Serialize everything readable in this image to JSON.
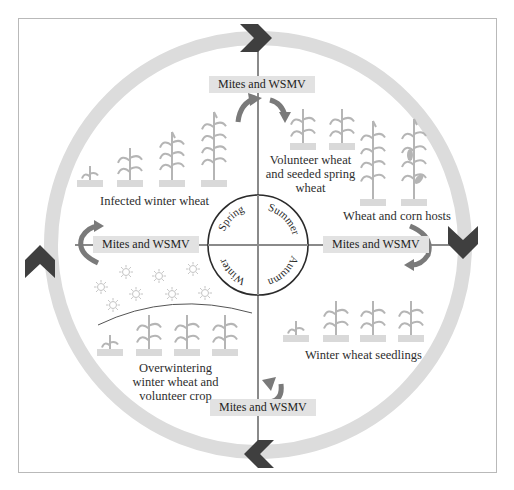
{
  "diagram": {
    "title_hidden": "",
    "seasons": [
      "Spring",
      "Summer",
      "Autumn",
      "Winter"
    ],
    "transfer_label": "Mites and WSMV",
    "stages": {
      "spring": "Infected winter wheat",
      "summer_1": "Volunteer wheat",
      "summer_2": "and seeded spring",
      "summer_3": "wheat",
      "summer_hosts": "Wheat and corn hosts",
      "autumn": "Winter wheat seedlings",
      "winter_1": "Overwintering",
      "winter_2": "winter wheat and",
      "winter_3": "volunteer crop"
    },
    "transfers": [
      {
        "position": "top",
        "label": "Mites and WSMV"
      },
      {
        "position": "right",
        "label": "Mites and WSMV"
      },
      {
        "position": "bottom",
        "label": "Mites and WSMV"
      },
      {
        "position": "left",
        "label": "Mites and WSMV"
      }
    ],
    "cycle_direction": "clockwise",
    "colors": {
      "ring": "#dcdcdc",
      "chevron": "#3f3f3f",
      "axis": "#8a8a8a",
      "plant": "#b5b5b5",
      "soil": "#d9d9d9",
      "label_bg": "#e2e2e2",
      "curved_arrow": "#7a7a7a",
      "season_circle": "#2b2b2b"
    }
  }
}
